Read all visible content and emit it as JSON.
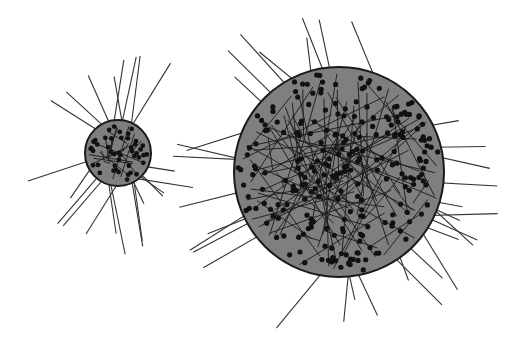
{
  "figure": {
    "background": "#ffffff",
    "fill_color": "#7f7f7f",
    "stroke_color": "#1a1a1a",
    "dot_color": "#111111",
    "particles": [
      {
        "name": "small-particle",
        "cx": 118,
        "cy": 153,
        "r": 33,
        "dots": 45,
        "internal_lines": 18,
        "external_lines": 22,
        "line_reach": 60,
        "seed": 7
      },
      {
        "name": "large-particle",
        "cx": 339,
        "cy": 172,
        "r": 105,
        "dots": 240,
        "internal_lines": 95,
        "external_lines": 34,
        "line_reach": 55,
        "seed": 23
      }
    ]
  }
}
